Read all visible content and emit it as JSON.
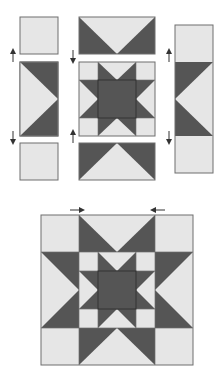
{
  "diagram": {
    "colors": {
      "light": "#e6e6e6",
      "dark": "#555555",
      "outline": "#6e6e6e",
      "arrow": "#333333"
    },
    "top_section": {
      "left_column": {
        "units": [
          "corner-square",
          "flying-geese-pointing-right",
          "corner-square"
        ],
        "press_arrows": [
          "up",
          "down"
        ]
      },
      "center_column": {
        "units": [
          "flying-geese-pointing-down",
          "center-star-block",
          "flying-geese-pointing-up"
        ],
        "press_arrows": [
          "down",
          "up"
        ]
      },
      "right_column": {
        "units": [
          "corner-square",
          "flying-geese-pointing-left",
          "corner-square"
        ],
        "press_arrows": [
          "up",
          "down"
        ]
      }
    },
    "bottom_section": {
      "label": "finished block",
      "press_arrows": [
        "right",
        "left"
      ]
    }
  }
}
